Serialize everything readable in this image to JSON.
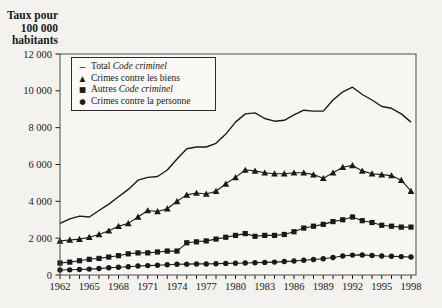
{
  "figure_title": "Taux de criminalite au Canada, 1962 a 1998",
  "y_axis_title_lines": [
    "Taux pour",
    "100 000",
    "habitants"
  ],
  "colors": {
    "page_bg": "#f3f2ee",
    "plot_bg": "#f7f6f2",
    "ink": "#1a1a1a",
    "border": "#4a4a4a",
    "legend_bg": "#faf9f5"
  },
  "chart_data": {
    "type": "line",
    "title": "",
    "xlabel": "",
    "ylabel": "Taux pour 100 000 habitants",
    "ylim": [
      0,
      12000
    ],
    "grid": false,
    "legend_position": "top-left-inside",
    "x_start": 1962,
    "x_end": 1998,
    "x_tick_labels": [
      "1962",
      "1965",
      "1968",
      "1971",
      "1974",
      "1977",
      "1980",
      "1983",
      "1986",
      "1989",
      "1992",
      "1995",
      "1998"
    ],
    "y_ticks": [
      {
        "value": 0,
        "label": "0"
      },
      {
        "value": 2000,
        "label": "2 000"
      },
      {
        "value": 4000,
        "label": "4 000"
      },
      {
        "value": 6000,
        "label": "6 000"
      },
      {
        "value": 8000,
        "label": "8 000"
      },
      {
        "value": 10000,
        "label": "10 000"
      },
      {
        "value": 12000,
        "label": "12 000"
      }
    ],
    "years": [
      1962,
      1963,
      1964,
      1965,
      1966,
      1967,
      1968,
      1969,
      1970,
      1971,
      1972,
      1973,
      1974,
      1975,
      1976,
      1977,
      1978,
      1979,
      1980,
      1981,
      1982,
      1983,
      1984,
      1985,
      1986,
      1987,
      1988,
      1989,
      1990,
      1991,
      1992,
      1993,
      1994,
      1995,
      1996,
      1997,
      1998
    ],
    "series": [
      {
        "id": "total",
        "name": "Total Code criminel",
        "name_prefix": "Total ",
        "name_italic": "Code criminel",
        "legend_glyph": "–",
        "marker": "none",
        "values": [
          2800,
          3050,
          3200,
          3150,
          3500,
          3850,
          4250,
          4650,
          5150,
          5300,
          5350,
          5700,
          6300,
          6850,
          6950,
          6950,
          7150,
          7650,
          8300,
          8750,
          8800,
          8500,
          8350,
          8400,
          8700,
          8950,
          8900,
          8900,
          9500,
          9950,
          10200,
          9800,
          9500,
          9150,
          9050,
          8750,
          8300
        ]
      },
      {
        "id": "biens",
        "name": "Crimes contre les biens",
        "name_prefix": "Crimes contre les biens",
        "name_italic": "",
        "legend_glyph": "▲",
        "marker": "triangle",
        "values": [
          1850,
          1900,
          1950,
          2050,
          2200,
          2400,
          2650,
          2800,
          3150,
          3500,
          3450,
          3600,
          4000,
          4350,
          4450,
          4400,
          4550,
          4950,
          5300,
          5700,
          5650,
          5550,
          5500,
          5500,
          5550,
          5550,
          5450,
          5250,
          5550,
          5850,
          5950,
          5650,
          5500,
          5450,
          5400,
          5150,
          4550
        ]
      },
      {
        "id": "autres",
        "name": "Autres Code criminel",
        "name_prefix": "Autres ",
        "name_italic": "Code criminel",
        "legend_glyph": "■",
        "marker": "square",
        "values": [
          650,
          700,
          775,
          850,
          900,
          975,
          1050,
          1150,
          1200,
          1200,
          1250,
          1300,
          1300,
          1750,
          1800,
          1850,
          1950,
          2050,
          2150,
          2250,
          2100,
          2150,
          2150,
          2200,
          2350,
          2550,
          2650,
          2750,
          2900,
          3000,
          3150,
          2950,
          2850,
          2700,
          2650,
          2600,
          2600
        ]
      },
      {
        "id": "personne",
        "name": "Crimes contre la personne",
        "name_prefix": "Crimes contre la personne",
        "name_italic": "",
        "legend_glyph": "●",
        "marker": "circle",
        "values": [
          270,
          280,
          300,
          320,
          350,
          390,
          420,
          450,
          490,
          510,
          530,
          560,
          580,
          590,
          600,
          600,
          610,
          630,
          640,
          650,
          665,
          685,
          700,
          730,
          760,
          800,
          840,
          880,
          950,
          1030,
          1080,
          1090,
          1060,
          1030,
          1020,
          1000,
          980
        ]
      }
    ]
  }
}
